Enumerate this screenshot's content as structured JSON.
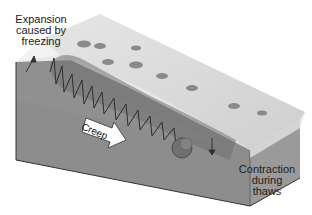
{
  "diagram": {
    "type": "geology-block-diagram",
    "labels": {
      "expansion": "Expansion caused by freezing",
      "expansion_lines": [
        "Expansion",
        "caused by",
        "freezing"
      ],
      "creep": "Creep",
      "contraction": "Contraction during thaws",
      "contraction_lines": [
        "Contraction",
        "during",
        "thaws"
      ]
    },
    "elements": [
      {
        "id": "slope-block",
        "description": "Cross-section block of hillside soil sloping down to the right"
      },
      {
        "id": "particle-path",
        "description": "Zig-zag arrows showing a soil particle lifted perpendicular to slope on freezing and dropping vertically on thawing"
      },
      {
        "id": "boulder",
        "description": "Rounded rock at end of particle path"
      },
      {
        "id": "creep-arrow",
        "description": "White block arrow pointing downslope"
      },
      {
        "id": "surface-pits",
        "description": "Dark oval depressions on the slope surface"
      }
    ],
    "colors": {
      "soil_side": "#8f8f8f",
      "surface_top": "#d9d9d9",
      "frost_layer": "#eeeeee",
      "zone": "#7a7a7a",
      "arrow_lines": "#333333"
    }
  }
}
